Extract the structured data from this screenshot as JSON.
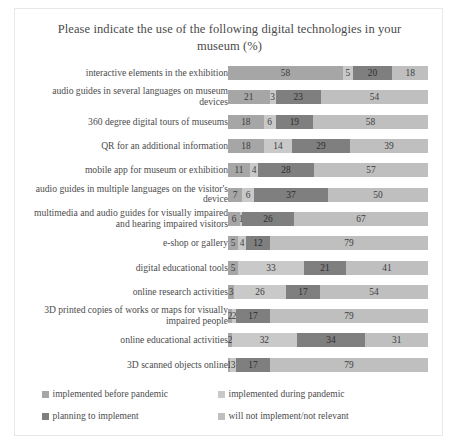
{
  "chart_data": {
    "type": "bar",
    "subtype": "stacked-horizontal-100",
    "title": "Please indicate the use of the following digital technologies in your museum (%)",
    "xlabel": "",
    "ylabel": "",
    "xlim": [
      0,
      100
    ],
    "grid": false,
    "legend_position": "bottom",
    "categories": [
      "interactive elements in the exhibition",
      "audio guides in several languages on museum devices",
      "360 degree digital tours of museums",
      "QR for an additional information",
      "mobile app for museum or exhibition",
      "audio guides in multiple languages on the visitor's device",
      "multimedia and audio guides for visually impaired and hearing impaired visitors",
      "e-shop or gallery",
      "digital educational tools",
      "online research activities",
      "3D printed copies of works or maps for visually impaired people",
      "online educational activities",
      "3D scanned objects online"
    ],
    "series": [
      {
        "name": "implemented before pandemic",
        "color": "#a6a6a6",
        "values": [
          58,
          21,
          18,
          18,
          11,
          7,
          6,
          5,
          5,
          3,
          2,
          2,
          1
        ]
      },
      {
        "name": "implemented during pandemic",
        "color": "#c9c9c9",
        "values": [
          5,
          3,
          6,
          14,
          4,
          6,
          1,
          4,
          33,
          26,
          2,
          32,
          3
        ]
      },
      {
        "name": "planning to implement",
        "color": "#7f7f7f",
        "values": [
          20,
          23,
          19,
          29,
          28,
          37,
          26,
          12,
          21,
          17,
          17,
          34,
          17
        ]
      },
      {
        "name": "will not implement/not relevant",
        "color": "#bfbfbf",
        "values": [
          18,
          54,
          58,
          39,
          57,
          50,
          67,
          79,
          41,
          54,
          79,
          31,
          79
        ]
      }
    ]
  }
}
